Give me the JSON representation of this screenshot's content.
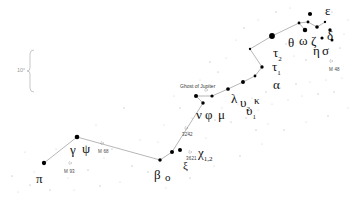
{
  "chart_data": {
    "type": "scatter",
    "title": "",
    "subtitle": "",
    "xlabel": "",
    "ylabel": "",
    "grid": false,
    "legend_position": "none",
    "xlim": [
      0,
      353
    ],
    "ylim": [
      0,
      204
    ],
    "background_color": "#ffffff",
    "star_color": "#000000",
    "line_color": "#7a7a7a",
    "scale_bar": {
      "label": "10°",
      "x": 30,
      "y_top": 50,
      "y_bottom": 92
    },
    "constellation_lines": [
      [
        [
          44,
          163
        ],
        [
          77,
          137
        ]
      ],
      [
        [
          77,
          137
        ],
        [
          160,
          160
        ]
      ],
      [
        [
          160,
          160
        ],
        [
          172,
          152
        ]
      ],
      [
        [
          172,
          152
        ],
        [
          203,
          103
        ]
      ],
      [
        [
          203,
          103
        ],
        [
          196,
          96
        ]
      ],
      [
        [
          196,
          96
        ],
        [
          212,
          96
        ]
      ],
      [
        [
          212,
          96
        ],
        [
          228,
          89
        ]
      ],
      [
        [
          228,
          89
        ],
        [
          243,
          82
        ]
      ],
      [
        [
          243,
          82
        ],
        [
          255,
          76
        ]
      ],
      [
        [
          255,
          76
        ],
        [
          262,
          67
        ]
      ],
      [
        [
          262,
          67
        ],
        [
          250,
          49
        ]
      ],
      [
        [
          250,
          49
        ],
        [
          272,
          36
        ]
      ],
      [
        [
          272,
          36
        ],
        [
          299,
          23
        ]
      ],
      [
        [
          299,
          23
        ],
        [
          308,
          22
        ]
      ],
      [
        [
          308,
          22
        ],
        [
          317,
          27
        ]
      ],
      [
        [
          317,
          27
        ],
        [
          325,
          22
        ]
      ],
      [
        [
          299,
          23
        ],
        [
          305,
          30
        ]
      ]
    ],
    "stars": [
      {
        "name": "pi",
        "x": 44,
        "y": 163,
        "mag": 3.3
      },
      {
        "name": "gamma",
        "x": 77,
        "y": 137,
        "mag": 3.0
      },
      {
        "name": "psi",
        "x": 160,
        "y": 160,
        "mag": 4.0
      },
      {
        "name": "beta",
        "x": 172,
        "y": 152,
        "mag": 3.5
      },
      {
        "name": "xi",
        "x": 180,
        "y": 150,
        "mag": 3.5
      },
      {
        "name": "chi",
        "x": 203,
        "y": 103,
        "mag": 4.0
      },
      {
        "name": "nu",
        "x": 196,
        "y": 96,
        "mag": 3.5
      },
      {
        "name": "phi",
        "x": 212,
        "y": 96,
        "mag": 4.2
      },
      {
        "name": "mu",
        "x": 228,
        "y": 89,
        "mag": 3.8
      },
      {
        "name": "lambda",
        "x": 243,
        "y": 82,
        "mag": 3.6
      },
      {
        "name": "upsilon2",
        "x": 255,
        "y": 76,
        "mag": 4.6
      },
      {
        "name": "upsilon1",
        "x": 262,
        "y": 67,
        "mag": 4.1
      },
      {
        "name": "kappa",
        "x": 250,
        "y": 49,
        "mag": 5.0
      },
      {
        "name": "alpha",
        "x": 272,
        "y": 36,
        "mag": 2.0
      },
      {
        "name": "tau1",
        "x": 299,
        "y": 23,
        "mag": 4.6
      },
      {
        "name": "tau2",
        "x": 308,
        "y": 22,
        "mag": 4.5
      },
      {
        "name": "theta",
        "x": 317,
        "y": 27,
        "mag": 3.9
      },
      {
        "name": "omega",
        "x": 325,
        "y": 22,
        "mag": 5.0
      },
      {
        "name": "zeta",
        "x": 305,
        "y": 30,
        "mag": 3.1
      },
      {
        "name": "epsilon",
        "x": 310,
        "y": 14,
        "mag": 3.4
      },
      {
        "name": "delta",
        "x": 330,
        "y": 30,
        "mag": 4.1
      },
      {
        "name": "eta",
        "x": 322,
        "y": 38,
        "mag": 4.3
      },
      {
        "name": "sigma",
        "x": 332,
        "y": 40,
        "mag": 4.4
      }
    ],
    "field_stars": [
      {
        "x": 12,
        "y": 176,
        "mag": 6.0
      },
      {
        "x": 25,
        "y": 152,
        "mag": 6.2
      },
      {
        "x": 30,
        "y": 185,
        "mag": 6.1
      },
      {
        "x": 34,
        "y": 172,
        "mag": 6.4
      },
      {
        "x": 56,
        "y": 149,
        "mag": 6.3
      },
      {
        "x": 68,
        "y": 178,
        "mag": 6.2
      },
      {
        "x": 88,
        "y": 170,
        "mag": 6.0
      },
      {
        "x": 96,
        "y": 125,
        "mag": 6.3
      },
      {
        "x": 112,
        "y": 149,
        "mag": 6.1
      },
      {
        "x": 120,
        "y": 182,
        "mag": 6.3
      },
      {
        "x": 140,
        "y": 140,
        "mag": 6.2
      },
      {
        "x": 148,
        "y": 172,
        "mag": 6.0
      },
      {
        "x": 164,
        "y": 125,
        "mag": 6.2
      },
      {
        "x": 188,
        "y": 132,
        "mag": 6.1
      },
      {
        "x": 192,
        "y": 118,
        "mag": 6.3
      },
      {
        "x": 206,
        "y": 138,
        "mag": 6.2
      },
      {
        "x": 215,
        "y": 120,
        "mag": 6.0
      },
      {
        "x": 222,
        "y": 108,
        "mag": 6.3
      },
      {
        "x": 231,
        "y": 122,
        "mag": 6.1
      },
      {
        "x": 238,
        "y": 104,
        "mag": 6.2
      },
      {
        "x": 246,
        "y": 118,
        "mag": 6.0
      },
      {
        "x": 252,
        "y": 98,
        "mag": 6.3
      },
      {
        "x": 258,
        "y": 110,
        "mag": 6.2
      },
      {
        "x": 266,
        "y": 92,
        "mag": 6.1
      },
      {
        "x": 272,
        "y": 104,
        "mag": 6.3
      },
      {
        "x": 280,
        "y": 88,
        "mag": 6.0
      },
      {
        "x": 288,
        "y": 100,
        "mag": 6.2
      },
      {
        "x": 296,
        "y": 84,
        "mag": 6.1
      },
      {
        "x": 302,
        "y": 96,
        "mag": 6.3
      },
      {
        "x": 310,
        "y": 82,
        "mag": 6.2
      },
      {
        "x": 318,
        "y": 94,
        "mag": 6.0
      },
      {
        "x": 326,
        "y": 80,
        "mag": 6.3
      },
      {
        "x": 334,
        "y": 92,
        "mag": 6.1
      },
      {
        "x": 342,
        "y": 78,
        "mag": 6.2
      },
      {
        "x": 236,
        "y": 40,
        "mag": 6.2
      },
      {
        "x": 244,
        "y": 28,
        "mag": 6.0
      },
      {
        "x": 258,
        "y": 20,
        "mag": 6.3
      },
      {
        "x": 286,
        "y": 44,
        "mag": 6.1
      },
      {
        "x": 294,
        "y": 56,
        "mag": 6.2
      },
      {
        "x": 306,
        "y": 60,
        "mag": 6.0
      },
      {
        "x": 318,
        "y": 52,
        "mag": 6.3
      },
      {
        "x": 340,
        "y": 48,
        "mag": 6.1
      },
      {
        "x": 344,
        "y": 34,
        "mag": 6.2
      },
      {
        "x": 276,
        "y": 12,
        "mag": 6.0
      },
      {
        "x": 290,
        "y": 8,
        "mag": 6.3
      },
      {
        "x": 332,
        "y": 12,
        "mag": 6.1
      },
      {
        "x": 348,
        "y": 20,
        "mag": 6.2
      },
      {
        "x": 180,
        "y": 108,
        "mag": 6.1
      },
      {
        "x": 174,
        "y": 96,
        "mag": 6.3
      },
      {
        "x": 158,
        "y": 142,
        "mag": 6.2
      },
      {
        "x": 132,
        "y": 166,
        "mag": 6.0
      },
      {
        "x": 104,
        "y": 158,
        "mag": 6.3
      },
      {
        "x": 200,
        "y": 80,
        "mag": 6.2
      },
      {
        "x": 218,
        "y": 72,
        "mag": 6.1
      },
      {
        "x": 226,
        "y": 58,
        "mag": 6.3
      },
      {
        "x": 210,
        "y": 62,
        "mag": 6.0
      },
      {
        "x": 18,
        "y": 192,
        "mag": 6.2
      },
      {
        "x": 50,
        "y": 190,
        "mag": 6.1
      },
      {
        "x": 74,
        "y": 190,
        "mag": 6.3
      },
      {
        "x": 100,
        "y": 186,
        "mag": 6.0
      },
      {
        "x": 166,
        "y": 188,
        "mag": 6.2
      },
      {
        "x": 190,
        "y": 178,
        "mag": 6.1
      },
      {
        "x": 214,
        "y": 166,
        "mag": 6.3
      },
      {
        "x": 240,
        "y": 156,
        "mag": 6.0
      },
      {
        "x": 262,
        "y": 144,
        "mag": 6.2
      },
      {
        "x": 284,
        "y": 130,
        "mag": 6.1
      },
      {
        "x": 306,
        "y": 122,
        "mag": 6.3
      },
      {
        "x": 328,
        "y": 116,
        "mag": 6.0
      },
      {
        "x": 348,
        "y": 108,
        "mag": 6.2
      },
      {
        "x": 124,
        "y": 108,
        "mag": 6.1
      },
      {
        "x": 256,
        "y": 130,
        "mag": 6.0
      },
      {
        "x": 268,
        "y": 124,
        "mag": 6.2
      }
    ],
    "star_labels": [
      {
        "id": "pi",
        "text": "π",
        "x": 36,
        "y": 172,
        "size": "greek"
      },
      {
        "id": "gamma",
        "text": "γ",
        "x": 70,
        "y": 143,
        "size": "greek"
      },
      {
        "id": "psi",
        "text": "ψ",
        "x": 82,
        "y": 142,
        "size": "greek"
      },
      {
        "id": "beta",
        "text": "β",
        "x": 154,
        "y": 168,
        "size": "greek"
      },
      {
        "id": "omicron",
        "text": "ο",
        "x": 165,
        "y": 172,
        "size": "greek-sm"
      },
      {
        "id": "xi",
        "text": "ξ",
        "x": 183,
        "y": 160,
        "size": "greek-sm"
      },
      {
        "id": "chi",
        "text": "χ",
        "x": 198,
        "y": 146,
        "size": "greek",
        "subscript": "1,2"
      },
      {
        "id": "nu",
        "text": "ν",
        "x": 196,
        "y": 108,
        "size": "greek"
      },
      {
        "id": "phi",
        "text": "φ",
        "x": 205,
        "y": 108,
        "size": "greek"
      },
      {
        "id": "mu",
        "text": "μ",
        "x": 218,
        "y": 108,
        "size": "greek"
      },
      {
        "id": "lambda",
        "text": "λ",
        "x": 231,
        "y": 92,
        "size": "greek"
      },
      {
        "id": "upsilon2",
        "text": "υ",
        "x": 240,
        "y": 96,
        "size": "greek",
        "subscript": "2"
      },
      {
        "id": "upsilon1",
        "text": "υ",
        "x": 246,
        "y": 104,
        "size": "greek",
        "subscript": "1"
      },
      {
        "id": "kappa",
        "text": "κ",
        "x": 254,
        "y": 95,
        "size": "greek-sm"
      },
      {
        "id": "alpha",
        "text": "α",
        "x": 273,
        "y": 78,
        "size": "greek"
      },
      {
        "id": "tau1",
        "text": "τ",
        "x": 272,
        "y": 60,
        "size": "greek",
        "subscript": "1"
      },
      {
        "id": "tau2",
        "text": "τ",
        "x": 273,
        "y": 46,
        "size": "greek",
        "subscript": "2"
      },
      {
        "id": "theta",
        "text": "θ",
        "x": 288,
        "y": 36,
        "size": "greek"
      },
      {
        "id": "omega",
        "text": "ω",
        "x": 299,
        "y": 34,
        "size": "greek"
      },
      {
        "id": "zeta",
        "text": "ζ",
        "x": 311,
        "y": 34,
        "size": "greek"
      },
      {
        "id": "epsilon",
        "text": "ε",
        "x": 325,
        "y": 4,
        "size": "greek"
      },
      {
        "id": "delta",
        "text": "δ",
        "x": 327,
        "y": 29,
        "size": "greek"
      },
      {
        "id": "eta",
        "text": "η",
        "x": 313,
        "y": 44,
        "size": "greek"
      },
      {
        "id": "sigma",
        "text": "σ",
        "x": 322,
        "y": 44,
        "size": "greek"
      }
    ],
    "deepsky_labels": [
      {
        "id": "ghost-of-jupiter",
        "text": "Ghost of Jupiter",
        "x": 180,
        "y": 84,
        "marker_x": 206,
        "marker_y": 90
      },
      {
        "id": "m93",
        "text": "M 93",
        "x": 64,
        "y": 170,
        "marker_x": 70,
        "marker_y": 163
      },
      {
        "id": "m68",
        "text": "M 68",
        "x": 98,
        "y": 150,
        "marker_x": 102,
        "marker_y": 143
      },
      {
        "id": "m48",
        "text": "M 48",
        "x": 329,
        "y": 68,
        "marker_x": 331,
        "marker_y": 61
      },
      {
        "id": "ngc3242",
        "text": "3242",
        "x": 182,
        "y": 133,
        "marker_x": 186,
        "marker_y": 128
      },
      {
        "id": "ngc3621",
        "text": "3621",
        "x": 186,
        "y": 157,
        "marker_x": 190,
        "marker_y": 152
      }
    ]
  }
}
